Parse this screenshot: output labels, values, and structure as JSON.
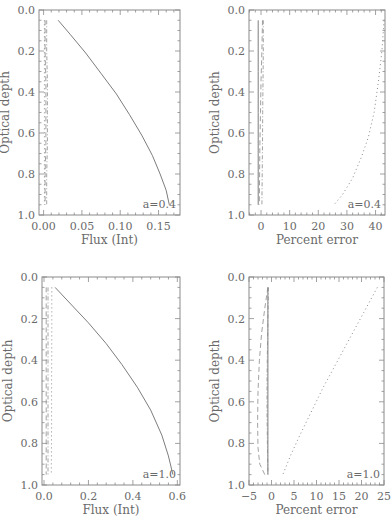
{
  "chart_data": [
    {
      "type": "line",
      "panel": "top-left",
      "frame_px": {
        "left": 39,
        "top": 10,
        "right": 180,
        "bottom": 215
      },
      "xlabel": "Flux (Int)",
      "ylabel": "Optical depth",
      "xlim": [
        -0.006,
        0.178
      ],
      "ylim": [
        0.0,
        1.0
      ],
      "y_inverted": true,
      "xticks": [
        0.0,
        0.05,
        0.1,
        0.15
      ],
      "xtick_labels": [
        "0.00",
        "0.05",
        "0.10",
        "0.15"
      ],
      "yticks": [
        0.0,
        0.2,
        0.4,
        0.6,
        0.8,
        1.0
      ],
      "ytick_labels": [
        "0.0",
        "0.2",
        "0.4",
        "0.6",
        "0.8",
        "1.0"
      ],
      "annotation": "a=0.4",
      "grid": false,
      "series": [
        {
          "name": "solid",
          "style": "solid",
          "x": [
            0.019,
            0.035,
            0.055,
            0.075,
            0.095,
            0.112,
            0.128,
            0.142,
            0.152,
            0.16,
            0.164
          ],
          "y": [
            0.05,
            0.12,
            0.21,
            0.31,
            0.41,
            0.51,
            0.61,
            0.71,
            0.8,
            0.88,
            0.95
          ]
        },
        {
          "name": "dashed",
          "style": "dashed",
          "x": [
            0.002,
            0.002,
            0.003,
            0.003,
            0.003,
            0.002,
            0.002
          ],
          "y": [
            0.05,
            0.2,
            0.35,
            0.5,
            0.65,
            0.8,
            0.95
          ]
        },
        {
          "name": "dash-dot",
          "style": "dashdot",
          "x": [
            0.004,
            0.004,
            0.005,
            0.005,
            0.005,
            0.004,
            0.004
          ],
          "y": [
            0.05,
            0.2,
            0.35,
            0.5,
            0.65,
            0.8,
            0.95
          ]
        },
        {
          "name": "dotted",
          "style": "dotted",
          "x": [
            0.001,
            0.001,
            0.001,
            0.001,
            0.001
          ],
          "y": [
            0.05,
            0.3,
            0.5,
            0.7,
            0.95
          ]
        }
      ]
    },
    {
      "type": "line",
      "panel": "top-right",
      "frame_px": {
        "left": 249,
        "top": 10,
        "right": 385,
        "bottom": 215
      },
      "xlabel": "Percent error",
      "ylabel": "Optical depth",
      "xlim": [
        -4.2,
        43.3
      ],
      "ylim": [
        0.0,
        1.0
      ],
      "y_inverted": true,
      "xticks": [
        0,
        10,
        20,
        30,
        40
      ],
      "xtick_labels": [
        "0",
        "10",
        "20",
        "30",
        "40"
      ],
      "yticks": [
        0.0,
        0.2,
        0.4,
        0.6,
        0.8,
        1.0
      ],
      "ytick_labels": [
        "0.0",
        "0.2",
        "0.4",
        "0.6",
        "0.8",
        "1.0"
      ],
      "annotation": "a=0.4",
      "grid": false,
      "series": [
        {
          "name": "solid",
          "style": "solid",
          "x": [
            -1.0,
            -1.0,
            -1.0,
            -1.0,
            -1.0
          ],
          "y": [
            0.05,
            0.3,
            0.5,
            0.7,
            0.95
          ]
        },
        {
          "name": "dashed",
          "style": "dashed",
          "x": [
            0.5,
            0.3,
            0.0,
            -0.2,
            -0.4,
            -0.5,
            -0.6
          ],
          "y": [
            0.05,
            0.2,
            0.35,
            0.5,
            0.65,
            0.8,
            0.95
          ]
        },
        {
          "name": "dash-dot",
          "style": "dashdot",
          "x": [
            0.8,
            0.8,
            0.7,
            0.6,
            0.5,
            0.4,
            0.3
          ],
          "y": [
            0.05,
            0.2,
            0.35,
            0.5,
            0.65,
            0.8,
            0.95
          ]
        },
        {
          "name": "dotted",
          "style": "dotted",
          "x": [
            43.0,
            42.2,
            41.0,
            39.5,
            37.5,
            35.0,
            32.0,
            28.5,
            25.5
          ],
          "y": [
            0.05,
            0.2,
            0.35,
            0.5,
            0.62,
            0.72,
            0.82,
            0.9,
            0.95
          ]
        }
      ]
    },
    {
      "type": "line",
      "panel": "bottom-left",
      "frame_px": {
        "left": 42,
        "top": 277,
        "right": 180,
        "bottom": 485
      },
      "xlabel": "Flux (Int)",
      "ylabel": "Optical depth",
      "xlim": [
        -0.009,
        0.612
      ],
      "ylim": [
        0.0,
        1.0
      ],
      "y_inverted": true,
      "xticks": [
        0.0,
        0.2,
        0.4,
        0.6
      ],
      "xtick_labels": [
        "0.0",
        "0.2",
        "0.4",
        "0.6"
      ],
      "yticks": [
        0.0,
        0.2,
        0.4,
        0.6,
        0.8,
        1.0
      ],
      "ytick_labels": [
        "0.0",
        "0.2",
        "0.4",
        "0.6",
        "0.8",
        "1.0"
      ],
      "annotation": "a=1.0",
      "grid": false,
      "series": [
        {
          "name": "solid",
          "style": "solid",
          "x": [
            0.05,
            0.12,
            0.2,
            0.28,
            0.35,
            0.42,
            0.48,
            0.53,
            0.56,
            0.58
          ],
          "y": [
            0.05,
            0.13,
            0.22,
            0.32,
            0.42,
            0.53,
            0.64,
            0.76,
            0.86,
            0.95
          ]
        },
        {
          "name": "dashed",
          "style": "dashed",
          "x": [
            0.01,
            0.01,
            0.01,
            0.01,
            0.01
          ],
          "y": [
            0.05,
            0.3,
            0.5,
            0.7,
            0.95
          ]
        },
        {
          "name": "dash-dot",
          "style": "dashdot",
          "x": [
            0.018,
            0.018,
            0.018,
            0.018,
            0.018
          ],
          "y": [
            0.05,
            0.3,
            0.5,
            0.7,
            0.95
          ]
        },
        {
          "name": "dotted",
          "style": "dotted",
          "x": [
            0.035,
            0.035,
            0.034,
            0.034,
            0.033
          ],
          "y": [
            0.05,
            0.3,
            0.5,
            0.7,
            0.95
          ]
        }
      ]
    },
    {
      "type": "line",
      "panel": "bottom-right",
      "frame_px": {
        "left": 249,
        "top": 277,
        "right": 384,
        "bottom": 485
      },
      "xlabel": "Percent error",
      "ylabel": "Optical depth",
      "xlim": [
        -5,
        25
      ],
      "ylim": [
        0.0,
        1.0
      ],
      "y_inverted": true,
      "xticks": [
        -5,
        0,
        5,
        10,
        15,
        20,
        25
      ],
      "xtick_labels": [
        "−5",
        "0",
        "5",
        "10",
        "15",
        "20",
        "25"
      ],
      "yticks": [
        0.0,
        0.2,
        0.4,
        0.6,
        0.8,
        1.0
      ],
      "ytick_labels": [
        "0.0",
        "0.2",
        "0.4",
        "0.6",
        "0.8",
        "1.0"
      ],
      "annotation": "a=1.0",
      "grid": false,
      "series": [
        {
          "name": "solid",
          "style": "solid",
          "x": [
            -0.8,
            -0.8,
            -0.8,
            -0.8,
            -0.8
          ],
          "y": [
            0.05,
            0.3,
            0.5,
            0.7,
            0.95
          ]
        },
        {
          "name": "dashed",
          "style": "dashed",
          "x": [
            -0.8,
            -1.5,
            -2.2,
            -2.7,
            -3.0,
            -3.1,
            -3.0,
            -2.6,
            -1.5
          ],
          "y": [
            0.05,
            0.15,
            0.27,
            0.4,
            0.55,
            0.7,
            0.82,
            0.9,
            0.95
          ]
        },
        {
          "name": "dash-dot",
          "style": "dashdot",
          "x": [
            -0.7,
            -0.8,
            -0.9,
            -1.0,
            -1.0,
            -0.9,
            -0.8
          ],
          "y": [
            0.05,
            0.2,
            0.35,
            0.5,
            0.65,
            0.8,
            0.95
          ]
        },
        {
          "name": "dotted",
          "style": "dotted",
          "x": [
            23.5,
            20.5,
            17.5,
            14.5,
            11.5,
            8.8,
            6.3,
            4.2,
            2.5
          ],
          "y": [
            0.05,
            0.17,
            0.29,
            0.41,
            0.53,
            0.65,
            0.76,
            0.86,
            0.95
          ]
        }
      ]
    }
  ]
}
